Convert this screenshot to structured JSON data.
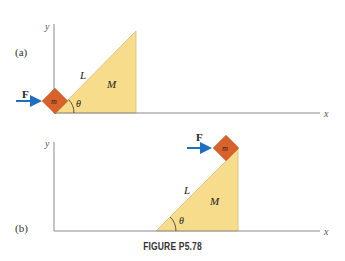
{
  "figure": {
    "caption": "FIGURE P5.78",
    "colors": {
      "axis": "#8a8a8a",
      "incline": "#f7dc8c",
      "incline_edge": "#c9b070",
      "block": "#d9622b",
      "force_arrow": "#1f6fc0",
      "text": "#222222"
    },
    "panel_a": {
      "label": "(a)",
      "axis_x": "x",
      "axis_y": "y",
      "force_label": "F",
      "block_label": "m",
      "incline_length_label": "L",
      "incline_mass_label": "M",
      "angle_label": "θ"
    },
    "panel_b": {
      "label": "(b)",
      "axis_x": "x",
      "axis_y": "y",
      "force_label": "F",
      "block_label": "m",
      "incline_length_label": "L",
      "incline_mass_label": "M",
      "angle_label": "θ"
    }
  }
}
